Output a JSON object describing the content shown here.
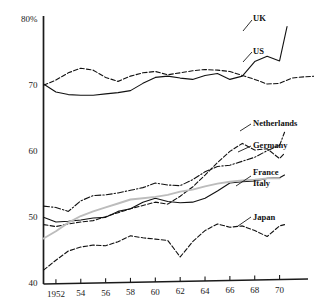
{
  "chart_data": {
    "type": "line",
    "title": "",
    "subtitle": "",
    "xlabel": "",
    "ylabel": "",
    "ylim": [
      40,
      80
    ],
    "xlim": [
      1951,
      1971
    ],
    "grid": false,
    "legend_position": "right-inline",
    "y_ticks": [
      40,
      50,
      60,
      70,
      80
    ],
    "y_tick_labels": [
      "40",
      "50",
      "60",
      "70",
      "80%"
    ],
    "x_ticks": [
      1952,
      1954,
      1956,
      1958,
      1960,
      1962,
      1964,
      1966,
      1968,
      1970
    ],
    "x_tick_labels": [
      "1952",
      "54",
      "56",
      "58",
      "60",
      "62",
      "64",
      "66",
      "68",
      "70"
    ],
    "x": [
      1951,
      1952,
      1953,
      1954,
      1955,
      1956,
      1957,
      1958,
      1959,
      1960,
      1961,
      1962,
      1963,
      1964,
      1965,
      1966,
      1967,
      1968,
      1969,
      1970
    ],
    "series": [
      {
        "name": "UK",
        "style": "solid",
        "color": "#111111",
        "values": [
          70.3,
          69.1,
          68.7,
          68.6,
          68.6,
          68.8,
          69.0,
          69.3,
          70.4,
          71.3,
          71.5,
          71.2,
          71.0,
          71.6,
          71.9,
          71.0,
          71.5,
          73.7,
          74.5,
          73.8
        ],
        "x_end": 1970.6,
        "value_end": 79.0
      },
      {
        "name": "US",
        "style": "dashed",
        "color": "#111111",
        "values": [
          70.1,
          70.9,
          72.0,
          72.7,
          72.4,
          71.3,
          70.7,
          71.5,
          72.0,
          72.2,
          71.7,
          72.0,
          72.3,
          72.5,
          72.4,
          72.2,
          71.6,
          71.0,
          70.3,
          70.4
        ],
        "x_tail": [
          1971,
          1972,
          1973
        ],
        "values_tail": [
          71.2,
          71.4,
          71.5
        ]
      },
      {
        "name": "Netherlands",
        "style": "dashdot",
        "color": "#111111",
        "values": [
          51.8,
          51.6,
          51.0,
          52.6,
          53.4,
          53.5,
          53.8,
          54.2,
          54.6,
          55.3,
          55.0,
          54.9,
          55.8,
          57.0,
          57.8,
          58.0,
          58.6,
          59.2,
          60.2,
          61.0
        ],
        "value_end": 63.0
      },
      {
        "name": "Germany",
        "style": "dashed",
        "color": "#111111",
        "values": [
          49.0,
          48.7,
          49.1,
          49.4,
          49.6,
          50.2,
          50.8,
          51.4,
          51.9,
          52.4,
          52.1,
          53.3,
          54.7,
          56.5,
          58.4,
          60.1,
          61.3,
          60.3,
          60.5,
          59.0
        ],
        "value_end": 59.8
      },
      {
        "name": "France",
        "style": "solid",
        "color": "#111111",
        "values": [
          50.1,
          49.4,
          49.5,
          49.7,
          50.0,
          50.1,
          51.0,
          51.4,
          52.4,
          53.0,
          52.5,
          52.3,
          52.4,
          53.0,
          54.1,
          55.3,
          55.5,
          55.6,
          56.0,
          56.1
        ],
        "value_end": 56.5
      },
      {
        "name": "Italy",
        "style": "solid-gray",
        "color": "#bcbcbc",
        "values": [
          46.9,
          48.0,
          49.3,
          50.3,
          51.0,
          51.6,
          52.2,
          52.8,
          53.0,
          53.2,
          53.5,
          54.0,
          54.3,
          54.8,
          55.2,
          55.5,
          55.7,
          55.8,
          56.0,
          56.0
        ]
      },
      {
        "name": "Japan",
        "style": "dashed",
        "color": "#111111",
        "values": [
          42.1,
          43.6,
          45.0,
          45.6,
          45.9,
          45.8,
          46.4,
          47.3,
          47.0,
          46.8,
          46.6,
          44.1,
          46.4,
          48.1,
          49.1,
          48.6,
          48.8,
          48.1,
          47.2,
          48.8
        ],
        "value_end": 49.0
      }
    ],
    "series_labels": [
      {
        "name": "UK",
        "x": 253,
        "y": 14
      },
      {
        "name": "US",
        "x": 253,
        "y": 47
      },
      {
        "name": "Netherlands",
        "x": 253,
        "y": 119
      },
      {
        "name": "Germany",
        "x": 253,
        "y": 141
      },
      {
        "name": "France",
        "x": 253,
        "y": 168
      },
      {
        "name": "Italy",
        "x": 253,
        "y": 179
      },
      {
        "name": "Japan",
        "x": 253,
        "y": 213
      }
    ]
  }
}
